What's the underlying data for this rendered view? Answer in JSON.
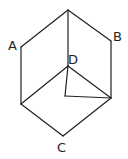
{
  "diagram": {
    "type": "geometry-figure",
    "labels": {
      "A": "A",
      "B": "B",
      "C": "C",
      "D": "D"
    },
    "stroke_color": "#231f20",
    "background": "#ffffff"
  }
}
